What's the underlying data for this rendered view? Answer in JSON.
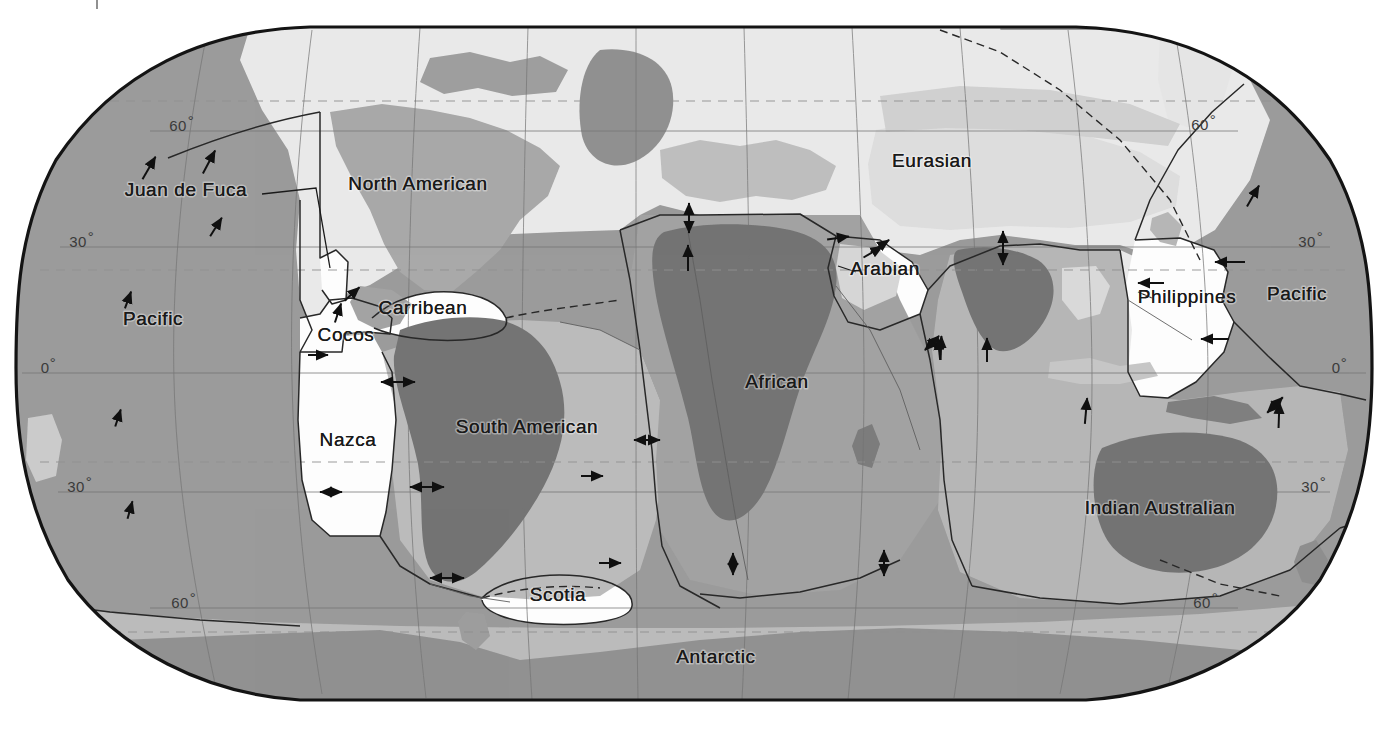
{
  "projection": "Robinson",
  "legend_present": false,
  "colors": {
    "background": "#ffffff",
    "outline": "#141414",
    "ocean_pacific": "#979797",
    "ocean_light": "#e9e9e9",
    "ocean_mid": "#b9b9b9",
    "plate_white": "#fdfdfd",
    "continent_dark": "#6f6f6f",
    "continent_mid": "#8d8d8d",
    "continent_light": "#c6c6c6",
    "graticule": "#6f6f6f",
    "boundary": "#202020",
    "arrow": "#101010",
    "label_text": "#1a1a1a",
    "lat_text": "#3a3a3a"
  },
  "plates": [
    {
      "name": "Juan de Fuca",
      "label": "Juan de Fuca",
      "x": 186,
      "y": 196,
      "anchor": "middle",
      "shade": "ocean_mid",
      "has_leader": true
    },
    {
      "name": "Pacific (east)",
      "label": "Pacific",
      "x": 153,
      "y": 325,
      "anchor": "middle",
      "shade": "ocean_pacific",
      "has_leader": false
    },
    {
      "name": "North American",
      "label": "North American",
      "x": 418,
      "y": 190,
      "anchor": "middle",
      "shade": "ocean_light",
      "has_leader": false
    },
    {
      "name": "Cocos",
      "label": "Cocos",
      "x": 346,
      "y": 341,
      "anchor": "middle",
      "shade": "plate_white",
      "has_leader": false
    },
    {
      "name": "Carribean",
      "label": "Carribean",
      "x": 423,
      "y": 314,
      "anchor": "middle",
      "shade": "plate_white",
      "has_leader": false
    },
    {
      "name": "Nazca",
      "label": "Nazca",
      "x": 348,
      "y": 446,
      "anchor": "middle",
      "shade": "plate_white",
      "has_leader": false
    },
    {
      "name": "South American",
      "label": "South American",
      "x": 527,
      "y": 433,
      "anchor": "middle",
      "shade": "ocean_mid",
      "has_leader": false
    },
    {
      "name": "Scotia",
      "label": "Scotia",
      "x": 558,
      "y": 601,
      "anchor": "middle",
      "shade": "plate_white",
      "has_leader": false
    },
    {
      "name": "African",
      "label": "African",
      "x": 777,
      "y": 388,
      "anchor": "middle",
      "shade": "continent_mid",
      "has_leader": false
    },
    {
      "name": "Eurasian",
      "label": "Eurasian",
      "x": 932,
      "y": 167,
      "anchor": "middle",
      "shade": "ocean_light",
      "has_leader": false
    },
    {
      "name": "Arabian",
      "label": "Arabian",
      "x": 885,
      "y": 275,
      "anchor": "middle",
      "shade": "plate_white",
      "has_leader": false
    },
    {
      "name": "Philippines",
      "label": "Philippines",
      "x": 1187,
      "y": 303,
      "anchor": "middle",
      "shade": "plate_white",
      "has_leader": false
    },
    {
      "name": "Pacific (west)",
      "label": "Pacific",
      "x": 1297,
      "y": 300,
      "anchor": "middle",
      "shade": "ocean_pacific",
      "has_leader": false
    },
    {
      "name": "Indian Australian",
      "label": "Indian Australian",
      "x": 1160,
      "y": 514,
      "anchor": "middle",
      "shade": "ocean_mid",
      "has_leader": false
    },
    {
      "name": "Antarctic",
      "label": "Antarctic",
      "x": 716,
      "y": 663,
      "anchor": "middle",
      "shade": "ocean_mid",
      "has_leader": false
    }
  ],
  "latitude_labels": [
    {
      "text": "60",
      "degree": "°",
      "x": 178,
      "y": 131,
      "side": "left"
    },
    {
      "text": "30",
      "degree": "°",
      "x": 78,
      "y": 247,
      "side": "left"
    },
    {
      "text": "0",
      "degree": "°",
      "x": 45,
      "y": 373,
      "side": "left"
    },
    {
      "text": "30",
      "degree": "°",
      "x": 76,
      "y": 492,
      "side": "left"
    },
    {
      "text": "60",
      "degree": "°",
      "x": 180,
      "y": 608,
      "side": "left"
    },
    {
      "text": "60",
      "degree": "°",
      "x": 1200,
      "y": 130,
      "side": "right"
    },
    {
      "text": "30",
      "degree": "°",
      "x": 1307,
      "y": 247,
      "side": "right"
    },
    {
      "text": "0",
      "degree": "°",
      "x": 1336,
      "y": 373,
      "side": "right"
    },
    {
      "text": "30",
      "degree": "°",
      "x": 1310,
      "y": 492,
      "side": "right"
    },
    {
      "text": "60",
      "degree": "°",
      "x": 1202,
      "y": 608,
      "side": "right"
    }
  ],
  "motion_arrows": [
    {
      "id": "jdf-1",
      "x": 149,
      "y": 168,
      "angle": -60,
      "len": 26,
      "double": false
    },
    {
      "id": "jdf-2",
      "x": 209,
      "y": 162,
      "angle": -62,
      "len": 26,
      "double": false
    },
    {
      "id": "pac-ne",
      "x": 216,
      "y": 227,
      "angle": -58,
      "len": 22,
      "double": false
    },
    {
      "id": "pac-e1",
      "x": 128,
      "y": 300,
      "angle": -70,
      "len": 18,
      "double": false
    },
    {
      "id": "pac-e2",
      "x": 118,
      "y": 418,
      "angle": -72,
      "len": 18,
      "double": false
    },
    {
      "id": "pac-e3",
      "x": 130,
      "y": 510,
      "angle": -74,
      "len": 18,
      "double": false
    },
    {
      "id": "cocos-n",
      "x": 338,
      "y": 313,
      "angle": -72,
      "len": 20,
      "double": false
    },
    {
      "id": "cocos-ne",
      "x": 352,
      "y": 294,
      "angle": -42,
      "len": 20,
      "double": false
    },
    {
      "id": "nazca-e1",
      "x": 318,
      "y": 355,
      "angle": 0,
      "len": 20,
      "double": false
    },
    {
      "id": "nazca-e2",
      "x": 398,
      "y": 382,
      "angle": 0,
      "len": 34,
      "double": true
    },
    {
      "id": "nazca-e3",
      "x": 427,
      "y": 487,
      "angle": 0,
      "len": 34,
      "double": true
    },
    {
      "id": "nazca-e4",
      "x": 331,
      "y": 492,
      "angle": 0,
      "len": 22,
      "double": true
    },
    {
      "id": "sam-e1",
      "x": 447,
      "y": 578,
      "angle": 0,
      "len": 34,
      "double": true
    },
    {
      "id": "sam-e2",
      "x": 592,
      "y": 476,
      "angle": 0,
      "len": 22,
      "double": false
    },
    {
      "id": "sam-e3",
      "x": 610,
      "y": 563,
      "angle": 0,
      "len": 22,
      "double": false
    },
    {
      "id": "matl-1",
      "x": 647,
      "y": 440,
      "angle": 0,
      "len": 26,
      "double": true
    },
    {
      "id": "afr-n1",
      "x": 689,
      "y": 218,
      "angle": -90,
      "len": 30,
      "double": true
    },
    {
      "id": "afr-n2",
      "x": 688,
      "y": 258,
      "angle": -90,
      "len": 26,
      "double": false
    },
    {
      "id": "afr-ne",
      "x": 838,
      "y": 238,
      "angle": -8,
      "len": 22,
      "double": false
    },
    {
      "id": "arab-ne1",
      "x": 873,
      "y": 252,
      "angle": -30,
      "len": 22,
      "double": false
    },
    {
      "id": "arab-ne2",
      "x": 880,
      "y": 246,
      "angle": -34,
      "len": 22,
      "double": false
    },
    {
      "id": "ind-n1",
      "x": 1003,
      "y": 248,
      "angle": -90,
      "len": 34,
      "double": true
    },
    {
      "id": "ind-n2",
      "x": 941,
      "y": 348,
      "angle": -88,
      "len": 24,
      "double": false
    },
    {
      "id": "ind-n3",
      "x": 987,
      "y": 350,
      "angle": -90,
      "len": 24,
      "double": false
    },
    {
      "id": "ind-n4",
      "x": 939,
      "y": 349,
      "angle": -96,
      "len": 22,
      "double": false
    },
    {
      "id": "ind-w1",
      "x": 884,
      "y": 563,
      "angle": -90,
      "len": 26,
      "double": true
    },
    {
      "id": "phil-w1",
      "x": 1230,
      "y": 262,
      "angle": 180,
      "len": 30,
      "double": false
    },
    {
      "id": "phil-w2",
      "x": 1151,
      "y": 283,
      "angle": 180,
      "len": 26,
      "double": false
    },
    {
      "id": "phil-w3",
      "x": 1215,
      "y": 339,
      "angle": 180,
      "len": 28,
      "double": false
    },
    {
      "id": "pac-w1",
      "x": 1253,
      "y": 196,
      "angle": -60,
      "len": 24,
      "double": false
    },
    {
      "id": "indaus-ne",
      "x": 1086,
      "y": 411,
      "angle": -85,
      "len": 26,
      "double": false
    },
    {
      "id": "indaus-ne2",
      "x": 1279,
      "y": 415,
      "angle": -88,
      "len": 26,
      "double": false
    },
    {
      "id": "indaus-x",
      "x": 1275,
      "y": 405,
      "angle": -45,
      "len": 22,
      "double": true
    },
    {
      "id": "sw-ind1",
      "x": 932,
      "y": 343,
      "angle": -45,
      "len": 20,
      "double": true
    },
    {
      "id": "ant-r1",
      "x": 733,
      "y": 564,
      "angle": -90,
      "len": 22,
      "double": true
    }
  ],
  "ridges_note": "dashed lines = uncertain boundaries; solid thin = plate boundaries",
  "artifact_top": {
    "present": true,
    "x": 96,
    "y": 0
  }
}
